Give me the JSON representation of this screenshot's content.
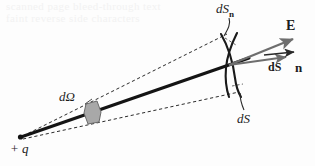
{
  "figure": {
    "kind": "physics-diagram",
    "width": 315,
    "height": 166,
    "background_color": "#fdfdfd"
  },
  "labels": {
    "dS_normal": {
      "main": "dS",
      "subscript": "n"
    },
    "field_vector": "E",
    "area_vector": "dS",
    "unit_normal": "n",
    "solid_angle": "dΩ",
    "area_element": "dS",
    "charge": "+ q"
  },
  "colors": {
    "ink": "#1c1c1c",
    "ray": "#141414",
    "dashed": "#2b2b2b",
    "vector_gray": "#6e6e6e",
    "patch_fill": "#a8a8a8",
    "patch_stroke": "#6a6a6a",
    "arc": "#1a1a1a",
    "bleed": "#f2f2f2"
  },
  "geometry": {
    "charge_point": {
      "x": 20,
      "y": 137
    },
    "intersection_point": {
      "x": 231,
      "y": 64
    },
    "cone_upper_edge": {
      "x1": 24,
      "y1": 135,
      "x2": 226,
      "y2": 35
    },
    "cone_lower_edge": {
      "x1": 24,
      "y1": 139,
      "x2": 237,
      "y2": 92
    },
    "ray": {
      "x1": 20,
      "y1": 137,
      "x2": 248,
      "y2": 58
    },
    "E_vector": {
      "x1": 231,
      "y1": 64,
      "x2": 297,
      "y2": 38
    },
    "dS_vector": {
      "x1": 231,
      "y1": 64,
      "x2": 290,
      "y2": 56
    },
    "solid_angle_patch": {
      "cx": 92,
      "cy": 113
    }
  },
  "bleed_through": {
    "line1": "scanned page bleed-through text",
    "line2": "faint reverse side characters"
  },
  "elements": [
    "point-charge",
    "central-ray",
    "cone-dashed-edges",
    "solid-angle-patch",
    "surface-arc-dS",
    "surface-arc-dSn",
    "electric-field-vector",
    "area-vector",
    "unit-normal-vector",
    "leader-lines"
  ]
}
